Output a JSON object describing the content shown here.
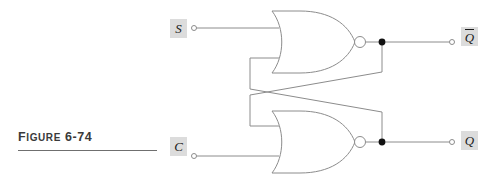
{
  "figure": {
    "caption_prefix": "F",
    "caption_rest": "IGURE",
    "caption_number": "6-74",
    "caption_full": "FIGURE 6-74"
  },
  "colors": {
    "wire": "#8c8c8c",
    "gate_outline": "#8c8c8c",
    "node_fill": "#111111",
    "label_box": "#dcdcdc",
    "label_text": "#1a1a1a",
    "caption_text": "#3a3a3a",
    "caption_rule": "#6f6f6f",
    "background": "#ffffff"
  },
  "inputs": [
    {
      "id": "S",
      "label": "S",
      "overbar": false,
      "terminal": "open-circle",
      "x": 195,
      "y": 28
    },
    {
      "id": "C",
      "label": "C",
      "overbar": false,
      "terminal": "open-circle",
      "x": 195,
      "y": 146
    }
  ],
  "outputs": [
    {
      "id": "Qbar",
      "label": "Q",
      "overbar": true,
      "terminal": "open-circle",
      "x": 452,
      "y": 42
    },
    {
      "id": "Q",
      "label": "Q",
      "overbar": false,
      "terminal": "open-circle",
      "x": 452,
      "y": 142
    }
  ],
  "gates": [
    {
      "id": "nor-top",
      "type": "NOR",
      "inputs": [
        "S",
        "feedback-from-Q"
      ],
      "output": "Qbar"
    },
    {
      "id": "nor-bottom",
      "type": "NOR",
      "inputs": [
        "feedback-from-Qbar",
        "C"
      ],
      "output": "Q"
    }
  ],
  "nodes": [
    {
      "id": "junction-qbar",
      "x": 382,
      "y": 42,
      "type": "solid-dot"
    },
    {
      "id": "junction-q",
      "x": 382,
      "y": 142,
      "type": "solid-dot"
    }
  ],
  "circuit": {
    "name": "cross-coupled NOR latch",
    "feedback_crossing": true
  }
}
